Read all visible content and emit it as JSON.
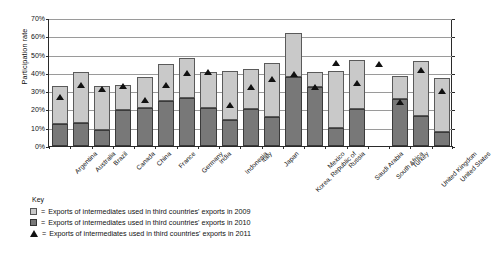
{
  "chart_data": {
    "type": "bar",
    "subtype": "stacked-bar-with-marker",
    "title": "",
    "xlabel": "",
    "ylabel": "Participation rate",
    "ylim": [
      0,
      70
    ],
    "ytick_labels": [
      "0%",
      "10%",
      "20%",
      "30%",
      "40%",
      "50%",
      "60%",
      "70%"
    ],
    "ytick_values": [
      0,
      10,
      20,
      30,
      40,
      50,
      60,
      70
    ],
    "grid": true,
    "legend_position": "below-plot",
    "legend_title": "Key",
    "categories": [
      "Argentina",
      "Australia",
      "Brazil",
      "Canada",
      "China",
      "France",
      "Germany",
      "India",
      "Indonesia",
      "Italy",
      "Japan",
      "Korea, Republic of",
      "Mexico",
      "Russia",
      "Saudi Arabia",
      "South Africa",
      "Turkey",
      "United Kingdom",
      "United States"
    ],
    "series": [
      {
        "name": "Exports of intermediates used in third countries' exports in 2009",
        "marker": "light-gray-square",
        "color": "#c9c9c9",
        "values": [
          33,
          40.5,
          33,
          33.5,
          37.5,
          45,
          48,
          40.5,
          41,
          42,
          45.5,
          62,
          40.5,
          41,
          47,
          null,
          38.5,
          46.5,
          37
        ]
      },
      {
        "name": "Exports of intermediates used in third countries' exports in 2010",
        "marker": "dark-gray-square",
        "color": "#787878",
        "values": [
          12,
          12.5,
          9,
          19.5,
          21,
          24.5,
          26,
          21,
          14,
          20.5,
          16,
          37.5,
          32.5,
          10,
          20.5,
          null,
          25.5,
          16.5,
          7.5
        ]
      },
      {
        "name": "Exports of intermediates used in third countries' exports in 2011",
        "marker": "black-triangle",
        "color": "#111111",
        "values": [
          27,
          33.5,
          31,
          33,
          25,
          33.5,
          40,
          40.5,
          22.5,
          32.5,
          36.5,
          39.5,
          32.5,
          45.5,
          34.5,
          45,
          24,
          41.5,
          30
        ]
      }
    ]
  },
  "axes": {
    "y_title": "Participation rate"
  },
  "key": {
    "title": "Key",
    "entries": [
      {
        "swatch": "light-gray-square",
        "equals": "=",
        "label": "Exports of intermediates used in third countries' exports in 2009"
      },
      {
        "swatch": "dark-gray-square",
        "equals": "=",
        "label": "Exports of intermediates used in third countries' exports in 2010"
      },
      {
        "swatch": "black-triangle",
        "equals": "=",
        "label": "Exports of intermediates used in third countries' exports in 2011"
      }
    ]
  }
}
